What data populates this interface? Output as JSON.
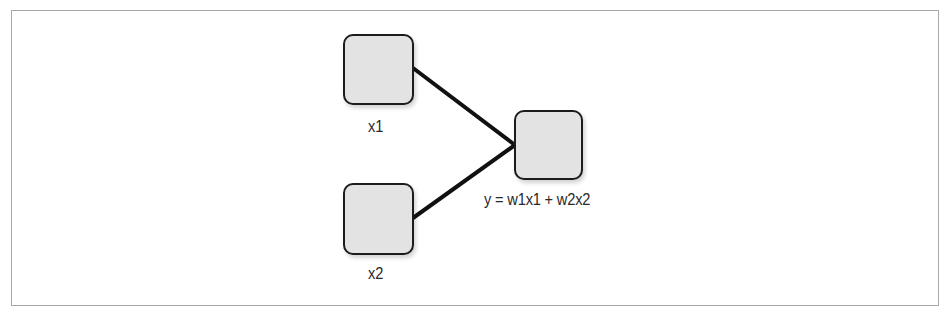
{
  "diagram": {
    "type": "neural-network",
    "colors": {
      "node_fill": "#e3e3e3",
      "node_border": "#1c1c1c",
      "edge": "#111111",
      "frame": "#a8a8a8"
    },
    "nodes": [
      {
        "id": "x1",
        "label": "x1",
        "role": "input"
      },
      {
        "id": "x2",
        "label": "x2",
        "role": "input"
      },
      {
        "id": "y",
        "label": "y = w1x1 + w2x2",
        "role": "output"
      }
    ],
    "edges": [
      {
        "from": "x1",
        "to": "y"
      },
      {
        "from": "x2",
        "to": "y"
      }
    ]
  }
}
